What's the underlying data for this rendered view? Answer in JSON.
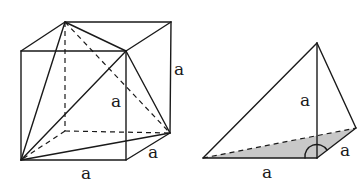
{
  "figures": [
    {
      "name": "cube-with-inscribed-tetrahedron",
      "labels": {
        "right_edge": "a",
        "inner_edge": "a",
        "depth_edge": "a",
        "bottom_edge": "a"
      }
    },
    {
      "name": "tetrahedron-corner",
      "labels": {
        "height": "a",
        "depth_edge": "a",
        "bottom_edge": "a"
      }
    }
  ],
  "colors": {
    "line": "#1a1a1a",
    "shade": "#c8c8c8",
    "background": "#ffffff"
  }
}
